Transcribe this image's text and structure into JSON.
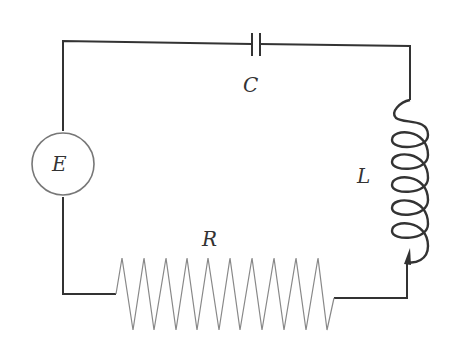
{
  "diagram": {
    "type": "RLC series circuit",
    "components": {
      "source": {
        "label": "E",
        "kind": "voltage-source"
      },
      "capacitor": {
        "label": "C",
        "kind": "capacitor"
      },
      "inductor": {
        "label": "L",
        "kind": "inductor"
      },
      "resistor": {
        "label": "R",
        "kind": "resistor"
      }
    },
    "colors": {
      "wire": "#333333",
      "source_circle": "#777777",
      "resistor": "#888888",
      "label": "#333333"
    }
  }
}
